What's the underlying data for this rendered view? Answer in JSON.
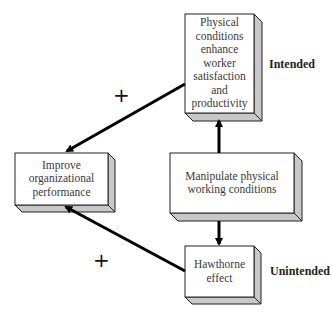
{
  "diagram": {
    "nodes": {
      "physical_conditions": {
        "label": "Physical conditions enhance worker satisfaction and productivity",
        "lines": [
          "Physical",
          "conditions",
          "enhance",
          "worker",
          "satisfaction",
          "and",
          "productivity"
        ]
      },
      "improve_performance": {
        "label": "Improve organizational performance",
        "lines": [
          "Improve",
          "organizational",
          "performance"
        ]
      },
      "manipulate_conditions": {
        "label": "Manipulate physical working conditions",
        "lines": [
          "Manipulate physical",
          "working conditions"
        ]
      },
      "hawthorne_effect": {
        "label": "Hawthorne effect",
        "lines": [
          "Hawthorne",
          "effect"
        ]
      }
    },
    "labels": {
      "intended": "Intended",
      "unintended": "Unintended"
    },
    "edges": [
      {
        "from": "manipulate_conditions",
        "to": "physical_conditions",
        "sign": ""
      },
      {
        "from": "manipulate_conditions",
        "to": "hawthorne_effect",
        "sign": ""
      },
      {
        "from": "physical_conditions",
        "to": "improve_performance",
        "sign": "+"
      },
      {
        "from": "hawthorne_effect",
        "to": "improve_performance",
        "sign": "+"
      }
    ],
    "signs": {
      "upper": "+",
      "lower": "+"
    },
    "colors": {
      "box_face": "#ffffff",
      "box_side": "#c8c8c8",
      "box_border": "#222222",
      "arrow": "#000000"
    }
  }
}
